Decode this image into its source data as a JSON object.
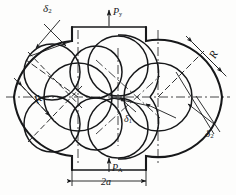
{
  "figure": {
    "type": "engineering-line-drawing",
    "background": "#fdfdfc",
    "ink_color": "#17181a"
  },
  "labels": {
    "delta2_top_left": "δ2",
    "delta2_top_left_base": "δ",
    "delta2_top_left_sub": "2",
    "pressure_top": "P",
    "pressure_top_sub": "y",
    "radius_right": "R",
    "radius_left": "R",
    "delta1_center": "δ",
    "delta1_center_sub": "1",
    "delta2_bottom_right": "δ",
    "delta2_bottom_right_sub": "2",
    "pressure_bottom": "P",
    "pressure_bottom_sub": "A",
    "width_dimension": "2a"
  },
  "geometry": {
    "center_line_y": 97,
    "left_lobe_center": [
      78,
      97
    ],
    "right_lobe_center": [
      158,
      97
    ],
    "outer_radius": 64,
    "rotor_radius": 34,
    "top_port": {
      "x1": 72,
      "x2": 146,
      "y_top": 27,
      "y_body": 41
    },
    "bottom_port": {
      "x1": 72,
      "x2": 146,
      "y_bottom": 170,
      "y_body": 156
    },
    "dimension_2a": {
      "x1": 72,
      "x2": 146,
      "y": 181
    }
  }
}
